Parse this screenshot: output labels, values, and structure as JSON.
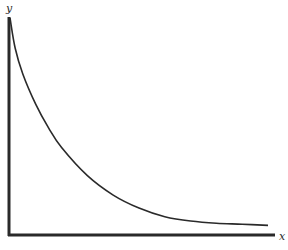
{
  "chart_data": {
    "type": "line",
    "title": "",
    "xlabel": "x",
    "ylabel": "y",
    "grid": false,
    "legend": null,
    "ticks": {
      "x": [],
      "y": []
    },
    "series": [
      {
        "name": "y(x)",
        "x": [
          0.0,
          0.02,
          0.05,
          0.1,
          0.15,
          0.2,
          0.3,
          0.4,
          0.5,
          0.6,
          0.7,
          0.8,
          0.9,
          1.0
        ],
        "values": [
          1.0,
          0.86,
          0.74,
          0.6,
          0.49,
          0.4,
          0.27,
          0.18,
          0.12,
          0.08,
          0.06,
          0.05,
          0.045,
          0.04
        ]
      }
    ],
    "xlim": [
      0,
      1
    ],
    "ylim": [
      0,
      1
    ]
  },
  "labels": {
    "y_axis": "y",
    "x_axis": "x"
  },
  "colors": {
    "axis": "#2a2a2a",
    "curve": "#2a2a2a",
    "background": "#ffffff"
  }
}
